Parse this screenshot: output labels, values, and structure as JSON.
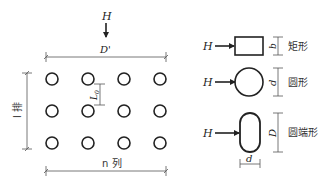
{
  "diagram": {
    "layout": {
      "force_label": "H",
      "width_label": "D'",
      "rows_label": "l 排",
      "columns_label": "n 列",
      "spacing_label": "L0",
      "spacing_label_main": "L",
      "spacing_label_sub": "0",
      "grid": {
        "rows": 3,
        "columns": 4
      }
    },
    "shapes": [
      {
        "id": "rectangle",
        "force_label": "H",
        "dim_label": "b",
        "name": "矩形"
      },
      {
        "id": "circle",
        "force_label": "H",
        "dim_label": "d",
        "name": "圆形"
      },
      {
        "id": "round-end",
        "force_label": "H",
        "dim_label": "D",
        "width_label": "d",
        "name": "圆端形"
      }
    ],
    "colors": {
      "stroke": "#222222",
      "dim_line": "#555555",
      "background": "#ffffff"
    }
  }
}
